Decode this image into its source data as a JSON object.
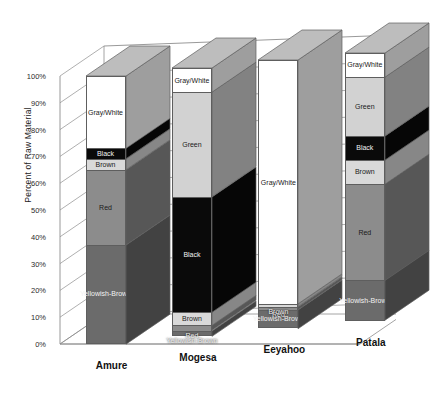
{
  "chart_data": {
    "type": "bar",
    "subtype": "stacked-column-3d",
    "title": "",
    "xlabel": "",
    "ylabel": "Percent of Raw Material",
    "ylim": [
      0,
      100
    ],
    "yticks": [
      "0%",
      "10%",
      "20%",
      "30%",
      "40%",
      "50%",
      "60%",
      "70%",
      "80%",
      "90%",
      "100%"
    ],
    "ytick_values": [
      0,
      10,
      20,
      30,
      40,
      50,
      60,
      70,
      80,
      90,
      100
    ],
    "grid": true,
    "legend": "none (segments labeled in place)",
    "stack_order": "bottom-to-top",
    "categories": [
      "Amure",
      "Mogesa",
      "Eeyahoo",
      "Patala"
    ],
    "series": [
      {
        "name": "Yellowish-Brown",
        "color": "#6b6b6b",
        "values": [
          37,
          2,
          7,
          15
        ]
      },
      {
        "name": "Red",
        "color": "#8c8c8c",
        "values": [
          28,
          2,
          1,
          36
        ]
      },
      {
        "name": "Brown",
        "color": "#d9d9d9",
        "values": [
          4,
          5,
          1,
          9
        ]
      },
      {
        "name": "Black",
        "color": "#0a0a0a",
        "values": [
          4,
          43,
          0,
          9
        ]
      },
      {
        "name": "Green",
        "color": "#d2d2d2",
        "values": [
          0,
          39,
          0,
          22
        ]
      },
      {
        "name": "Gray/White",
        "color": "#ffffff",
        "values": [
          27,
          9,
          91,
          9
        ]
      }
    ]
  },
  "axis": {
    "y_title": "Percent of Raw Material"
  },
  "style": {
    "plot_background": "#ffffff",
    "gridline_color": "#8d8d8d",
    "axis_color": "#8d8d8d",
    "bar_outline": "#5e5e5e",
    "side_shade": "#787878",
    "top_shade": "#9e9e9e"
  }
}
